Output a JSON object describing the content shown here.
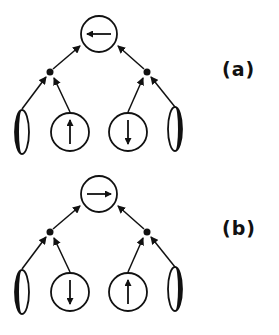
{
  "panels": [
    {
      "label": "(a)",
      "top_spin": "left",
      "inputs": [
        "ellipse-left-filled",
        "up",
        "down",
        "ellipse-right-filled"
      ]
    },
    {
      "label": "(b)",
      "top_spin": "right",
      "inputs": [
        "ellipse-left-filled",
        "down",
        "up",
        "ellipse-right-filled"
      ]
    }
  ],
  "colors": {
    "ink": "#111111",
    "background": "#ffffff"
  }
}
